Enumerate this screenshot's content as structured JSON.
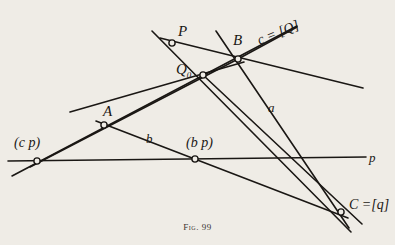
{
  "figure": {
    "caption": "Fig. 99",
    "background_color": "#efece6",
    "ink_color": "#1a1714"
  },
  "points": [
    {
      "id": "P",
      "label": "P",
      "x": 172,
      "y": 43,
      "label_x": 178,
      "label_y": 24
    },
    {
      "id": "B",
      "label": "B",
      "x": 238,
      "y": 59,
      "label_x": 233,
      "label_y": 33
    },
    {
      "id": "Q0",
      "label": "Q",
      "sub": "0",
      "x": 203,
      "y": 75,
      "label_x": 176,
      "label_y": 62
    },
    {
      "id": "A",
      "label": "A",
      "x": 104,
      "y": 125,
      "label_x": 103,
      "label_y": 104
    },
    {
      "id": "cp",
      "label": "(c p)",
      "x": 37,
      "y": 161,
      "label_x": 14,
      "label_y": 136
    },
    {
      "id": "bp",
      "label": "(b p)",
      "x": 195,
      "y": 159,
      "label_x": 186,
      "label_y": 136
    },
    {
      "id": "C",
      "label": "C =[q]",
      "x": 341,
      "y": 212,
      "label_x": 349,
      "label_y": 198
    }
  ],
  "line_labels": [
    {
      "id": "a",
      "label": "a",
      "x": 268,
      "y": 101
    },
    {
      "id": "b",
      "label": "b",
      "x": 146,
      "y": 132
    },
    {
      "id": "p",
      "label": "p",
      "x": 369,
      "y": 151
    },
    {
      "id": "cQ",
      "label": "c = [Q]",
      "x": 258,
      "y": 34
    }
  ],
  "chart_data": {
    "type": "diagram",
    "title": "Fig. 99",
    "segments": [
      {
        "id": "line-p",
        "x1": 8,
        "y1": 161,
        "x2": 366,
        "y2": 157,
        "width": 1.6
      },
      {
        "id": "line-c",
        "x1": 12,
        "y1": 176,
        "x2": 297,
        "y2": 26,
        "width": 1.6
      },
      {
        "id": "line-q-P-C",
        "x1": 152,
        "y1": 31,
        "x2": 351,
        "y2": 232,
        "width": 1.6
      },
      {
        "id": "line-a-B-C",
        "x1": 216,
        "y1": 31,
        "x2": 349,
        "y2": 228,
        "width": 1.6
      },
      {
        "id": "line-P-B-right",
        "x1": 160,
        "y1": 38,
        "x2": 363,
        "y2": 88,
        "width": 1.6
      },
      {
        "id": "line-b-Q0-bp-C",
        "x1": 203,
        "y1": 75,
        "x2": 362,
        "y2": 224,
        "width": 1.6
      },
      {
        "id": "line-A-through-B",
        "x1": 70,
        "y1": 112,
        "x2": 244,
        "y2": 62,
        "width": 1.6
      },
      {
        "id": "line-cp-Q0-B",
        "x1": 30,
        "y1": 167,
        "x2": 240,
        "y2": 58,
        "width": 1.6
      },
      {
        "id": "line-A-b-bp-C",
        "x1": 96,
        "y1": 121,
        "x2": 348,
        "y2": 218,
        "width": 1.6
      },
      {
        "id": "line-c-tail-right",
        "x1": 238,
        "y1": 59,
        "x2": 297,
        "y2": 27,
        "width": 1.6
      }
    ]
  }
}
